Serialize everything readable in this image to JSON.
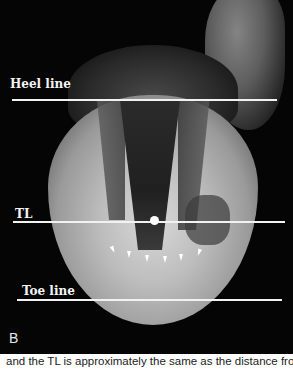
{
  "figure": {
    "panel_label": "B",
    "annotations": {
      "heel_line": "Heel line",
      "tl": "TL",
      "toe_line": "Toe line"
    },
    "arrow_count": 6,
    "colors": {
      "background": "#050505",
      "annotation": "#f2f2f2"
    }
  },
  "caption": {
    "text": "and the TL is approximately the same as the distance from t"
  }
}
